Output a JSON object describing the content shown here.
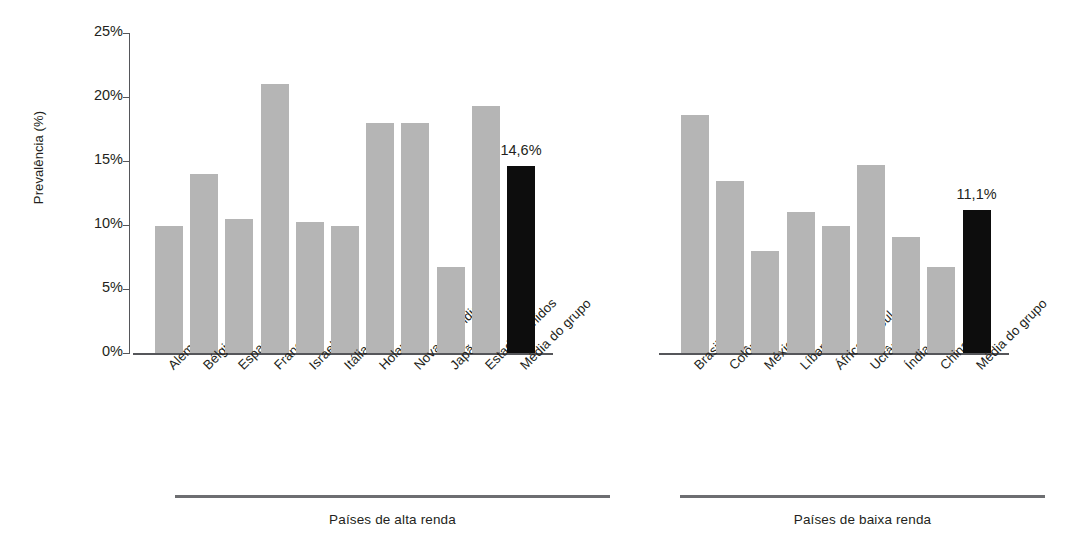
{
  "chart_data": {
    "type": "bar",
    "title": "",
    "xlabel": "",
    "ylabel": "Prevalência (%)",
    "ylim": [
      0,
      25
    ],
    "ytick_labels": [
      "0%",
      "5%",
      "10%",
      "15%",
      "20%",
      "25%"
    ],
    "ytick_values": [
      0,
      5,
      10,
      15,
      20,
      25
    ],
    "grid": false,
    "legend": false,
    "colors": {
      "bar_gray": "#b5b5b5",
      "bar_black": "#0d0d0d",
      "axis": "#55565a",
      "rule": "#6d6e71",
      "text": "#231f20"
    },
    "groups": [
      {
        "name": "Países de alta renda",
        "label": "Países de alta renda",
        "categories": [
          "Alemanha",
          "Bélgica",
          "Espanha",
          "França",
          "Israel",
          "Itália",
          "Holanda",
          "Nova Zelândia",
          "Japão",
          "Estados Unidos",
          "Média do grupo"
        ],
        "values": [
          9.9,
          14.0,
          10.5,
          21.0,
          10.2,
          9.9,
          18.0,
          18.0,
          6.7,
          19.3,
          14.6
        ],
        "highlight_index": 10,
        "value_labels": [
          "",
          "",
          "",
          "",
          "",
          "",
          "",
          "",
          "",
          "",
          "14,6%"
        ]
      },
      {
        "name": "Países de baixa renda",
        "label": "Países de baixa renda",
        "categories": [
          "Brasil",
          "Colômbia",
          "México",
          "Líbano",
          "África do Sul",
          "Ucrânia",
          "Índia",
          "China",
          "Média do grupo"
        ],
        "values": [
          18.6,
          13.4,
          8.0,
          11.0,
          9.9,
          14.7,
          9.1,
          6.7,
          11.2
        ],
        "highlight_index": 8,
        "value_labels": [
          "",
          "",
          "",
          "",
          "",
          "",
          "",
          "",
          "11,1%"
        ]
      }
    ]
  }
}
